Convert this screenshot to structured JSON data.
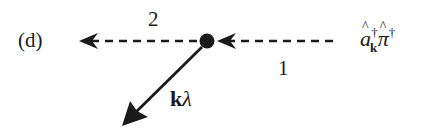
{
  "diagram": {
    "panel_label": "(d)",
    "vertex": {
      "shape": "filled-circle",
      "color": "#1a1a1a"
    },
    "lines": [
      {
        "id": "line-1",
        "style": "dashed",
        "direction": "right-to-left",
        "label": "1",
        "into": "vertex"
      },
      {
        "id": "line-2",
        "style": "dashed",
        "direction": "right-to-left",
        "label": "2",
        "from": "vertex"
      },
      {
        "id": "photon-line",
        "style": "solid",
        "direction": "down-left",
        "label_k": "k",
        "label_lambda": "λ",
        "from": "vertex"
      }
    ],
    "operator_label": {
      "a": "a",
      "a_sub": "k",
      "a_sup": "†",
      "pi": "π",
      "pi_sup": "†"
    },
    "ink_color": "#1a1a1a",
    "background": "#ffffff"
  }
}
